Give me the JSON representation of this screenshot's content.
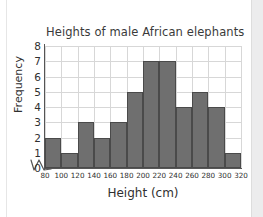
{
  "chart_data": {
    "type": "bar",
    "title": "Heights of male African elephants",
    "xlabel": "Height (cm)",
    "ylabel": "Frequency",
    "bin_edges": [
      80,
      100,
      120,
      140,
      160,
      180,
      200,
      220,
      240,
      260,
      280,
      300,
      320
    ],
    "categories": [
      "80-100",
      "100-120",
      "120-140",
      "140-160",
      "160-180",
      "180-200",
      "200-220",
      "220-240",
      "240-260",
      "260-280",
      "280-300",
      "300-320"
    ],
    "values": [
      2,
      1,
      3,
      2,
      3,
      5,
      7,
      7,
      4,
      5,
      4,
      1
    ],
    "xticklabels": [
      "80",
      "100",
      "120",
      "140",
      "160",
      "180",
      "200",
      "220",
      "240",
      "260",
      "280",
      "300",
      "320"
    ],
    "yticklabels": [
      "0",
      "1",
      "2",
      "3",
      "4",
      "5",
      "6",
      "7",
      "8"
    ],
    "ylim": [
      0,
      8
    ],
    "xlim": [
      80,
      320
    ],
    "grid": true,
    "legend": false,
    "bar_color": "#6f6f6f",
    "bar_edge_color": "#4a4a4a",
    "grid_color": "#d7d7d7",
    "axis_color": "#555555",
    "axis_break": true
  }
}
